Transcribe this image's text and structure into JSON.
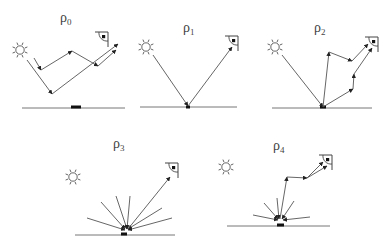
{
  "diagram": {
    "colors": {
      "line": "#555555",
      "ground": "#777777",
      "label": "#444444",
      "background": "#ffffff"
    },
    "panels": [
      {
        "id": "rho0",
        "label_base": "ρ",
        "label_sub": "0",
        "label_pos": [
          60,
          22
        ],
        "sun": [
          20,
          50
        ],
        "eye": [
          108,
          32
        ],
        "ground": [
          [
            22,
            108
          ],
          [
            125,
            108
          ]
        ],
        "patch": [
          [
            71,
            107
          ],
          [
            81,
            107
          ]
        ],
        "rays": [
          [
            [
              27,
              60
            ],
            [
              52,
              94
            ],
            [
              118,
              44
            ]
          ],
          [
            [
              34,
              58
            ],
            [
              41,
              70
            ],
            [
              72,
              51
            ],
            [
              98,
              66
            ],
            [
              116,
              50
            ]
          ]
        ]
      },
      {
        "id": "rho1",
        "label_base": "ρ",
        "label_sub": "1",
        "label_pos": [
          183,
          32
        ],
        "sun": [
          146,
          47
        ],
        "eye": [
          238,
          36
        ],
        "ground": [
          [
            140,
            107
          ],
          [
            237,
            107
          ]
        ],
        "patch": [
          [
            186,
            107
          ],
          [
            190,
            107
          ]
        ],
        "rays": [
          [
            [
              153,
              55
            ],
            [
              188,
              106
            ],
            [
              232,
              47
            ]
          ]
        ]
      },
      {
        "id": "rho2",
        "label_base": "ρ",
        "label_sub": "2",
        "label_pos": [
          314,
          32
        ],
        "sun": [
          275,
          47
        ],
        "eye": [
          378,
          37
        ],
        "ground": [
          [
            272,
            108
          ],
          [
            372,
            108
          ]
        ],
        "patch": [
          [
            320,
            107
          ],
          [
            326,
            107
          ]
        ],
        "rays": [
          [
            [
              282,
              55
            ],
            [
              323,
              107
            ],
            [
              329,
              52
            ],
            [
              352,
              61
            ],
            [
              368,
              44
            ]
          ],
          [
            [
              323,
              107
            ],
            [
              353,
              89
            ],
            [
              354,
              74
            ],
            [
              372,
              48
            ]
          ]
        ]
      },
      {
        "id": "rho3",
        "label_base": "ρ",
        "label_sub": "3",
        "label_pos": [
          113,
          148
        ],
        "sun": [
          73,
          177
        ],
        "eye": [
          178,
          163
        ],
        "ground": [
          [
            75,
            235
          ],
          [
            175,
            235
          ]
        ],
        "patch": [
          [
            121,
            234
          ],
          [
            127,
            234
          ]
        ],
        "rays": [
          [
            [
              87,
              218
            ],
            [
              125,
              230
            ]
          ],
          [
            [
              101,
              202
            ],
            [
              125,
              229
            ]
          ],
          [
            [
              116,
              196
            ],
            [
              127,
              229
            ]
          ],
          [
            [
              130,
              196
            ],
            [
              127,
              229
            ]
          ],
          [
            [
              162,
              208
            ],
            [
              128,
              229
            ]
          ],
          [
            [
              172,
              218
            ],
            [
              128,
              230
            ]
          ],
          [
            [
              128,
              229
            ],
            [
              170,
              177
            ]
          ]
        ]
      },
      {
        "id": "rho4",
        "label_base": "ρ",
        "label_sub": "4",
        "label_pos": [
          273,
          150
        ],
        "sun": [
          226,
          167
        ],
        "eye": [
          332,
          155
        ],
        "ground": [
          [
            227,
            226
          ],
          [
            330,
            226
          ]
        ],
        "patch": [
          [
            277,
            225
          ],
          [
            284,
            225
          ]
        ],
        "rays": [
          [
            [
              253,
              215
            ],
            [
              278,
              220
            ]
          ],
          [
            [
              264,
              203
            ],
            [
              278,
              219
            ]
          ],
          [
            [
              277,
              198
            ],
            [
              279,
              219
            ]
          ],
          [
            [
              294,
              201
            ],
            [
              282,
              219
            ]
          ],
          [
            [
              310,
              217
            ],
            [
              283,
              220
            ]
          ],
          [
            [
              280,
              219
            ],
            [
              287,
              177
            ],
            [
              307,
              178
            ]
          ],
          [
            [
              307,
              178
            ],
            [
              323,
              162
            ]
          ],
          [
            [
              307,
              178
            ],
            [
              327,
              166
            ]
          ]
        ]
      }
    ]
  }
}
